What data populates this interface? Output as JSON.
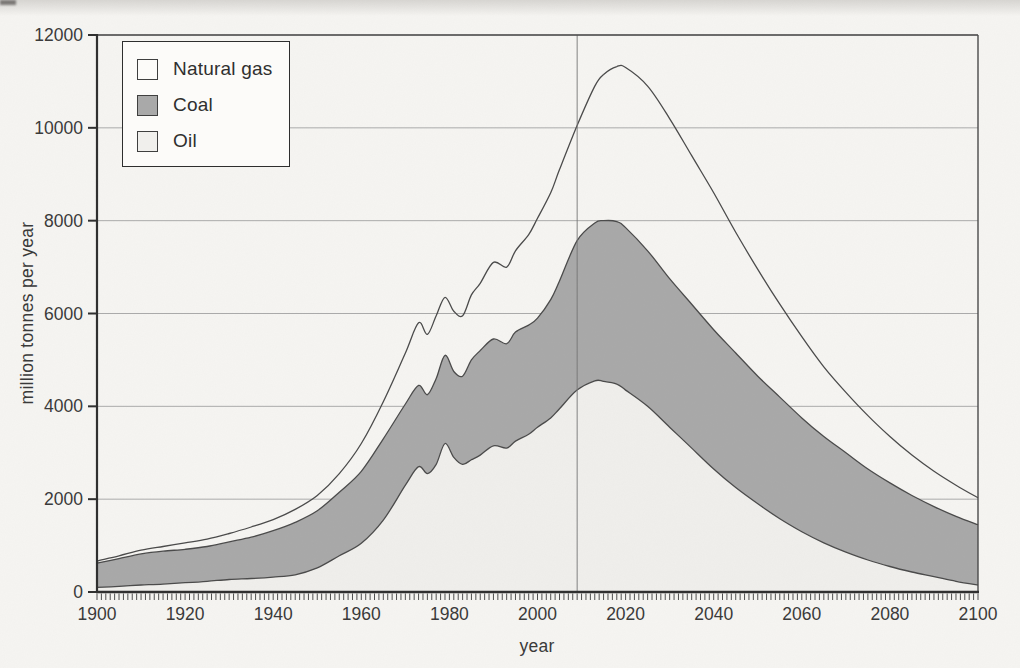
{
  "figure": {
    "background_color": "#f6f5f2",
    "frame_color": "#4a4a4a",
    "axis_color": "#2f2f2f",
    "gridline_color": "#a3a3a3",
    "line_color": "#4b4b4b",
    "now_line_color": "#757575",
    "tick_label_color": "#3a3a3a"
  },
  "chart_data": {
    "type": "area",
    "stacked": true,
    "title": "",
    "xlabel": "year",
    "ylabel": "million tonnes per year",
    "xlim": [
      1900,
      2100
    ],
    "ylim": [
      0,
      12000
    ],
    "x_ticks_labeled": [
      1900,
      1920,
      1940,
      1960,
      1980,
      2000,
      2020,
      2040,
      2060,
      2080,
      2100
    ],
    "x_minor_tick_step_years": 1,
    "y_ticks": [
      0,
      2000,
      4000,
      6000,
      8000,
      10000,
      12000
    ],
    "grid": "horizontal",
    "now_line_year": 2009,
    "legend": {
      "position": "top-left",
      "entries": [
        {
          "label": "Natural gas",
          "color": "#fcfbf9"
        },
        {
          "label": "Coal",
          "color": "#a9a9a9"
        },
        {
          "label": "Oil",
          "color": "#f0efec"
        }
      ]
    },
    "x": [
      1900,
      1905,
      1910,
      1915,
      1920,
      1925,
      1930,
      1935,
      1940,
      1945,
      1950,
      1955,
      1960,
      1965,
      1970,
      1973,
      1975,
      1977,
      1979,
      1981,
      1983,
      1985,
      1987,
      1990,
      1993,
      1995,
      1998,
      2000,
      2003,
      2005,
      2009,
      2013,
      2015,
      2018,
      2020,
      2025,
      2030,
      2035,
      2040,
      2045,
      2050,
      2055,
      2060,
      2065,
      2070,
      2075,
      2080,
      2085,
      2090,
      2095,
      2100
    ],
    "series": [
      {
        "name": "Oil",
        "color": "#f0efec",
        "outlined": true,
        "values": [
          100,
          120,
          150,
          170,
          200,
          230,
          270,
          290,
          320,
          370,
          520,
          780,
          1050,
          1550,
          2300,
          2700,
          2550,
          2750,
          3200,
          2900,
          2750,
          2850,
          2950,
          3150,
          3100,
          3250,
          3400,
          3550,
          3750,
          3950,
          4350,
          4550,
          4540,
          4480,
          4350,
          4000,
          3550,
          3100,
          2650,
          2250,
          1900,
          1580,
          1300,
          1060,
          860,
          690,
          550,
          430,
          330,
          230,
          150
        ]
      },
      {
        "name": "Coal",
        "color": "#a9a9a9",
        "outlined": true,
        "values": [
          520,
          600,
          670,
          710,
          720,
          750,
          810,
          890,
          1000,
          1130,
          1230,
          1370,
          1550,
          1750,
          1750,
          1750,
          1700,
          1850,
          1900,
          1850,
          1900,
          2150,
          2250,
          2300,
          2250,
          2350,
          2350,
          2350,
          2550,
          2750,
          3220,
          3400,
          3460,
          3500,
          3500,
          3350,
          3200,
          3100,
          3000,
          2900,
          2750,
          2620,
          2450,
          2290,
          2140,
          1960,
          1800,
          1650,
          1510,
          1400,
          1300
        ]
      },
      {
        "name": "Natural gas",
        "color": "none",
        "outlined": true,
        "values": [
          50,
          60,
          80,
          100,
          140,
          160,
          180,
          220,
          240,
          280,
          330,
          400,
          600,
          800,
          1100,
          1350,
          1300,
          1350,
          1250,
          1300,
          1300,
          1400,
          1450,
          1650,
          1650,
          1750,
          1950,
          2150,
          2300,
          2400,
          2480,
          2950,
          3150,
          3340,
          3450,
          3550,
          3450,
          3200,
          2950,
          2600,
          2300,
          2000,
          1750,
          1500,
          1300,
          1150,
          1000,
          870,
          760,
          670,
          580
        ]
      }
    ],
    "annotations": [
      {
        "type": "vline",
        "x": 2009,
        "note": "present-day marker line"
      }
    ]
  }
}
